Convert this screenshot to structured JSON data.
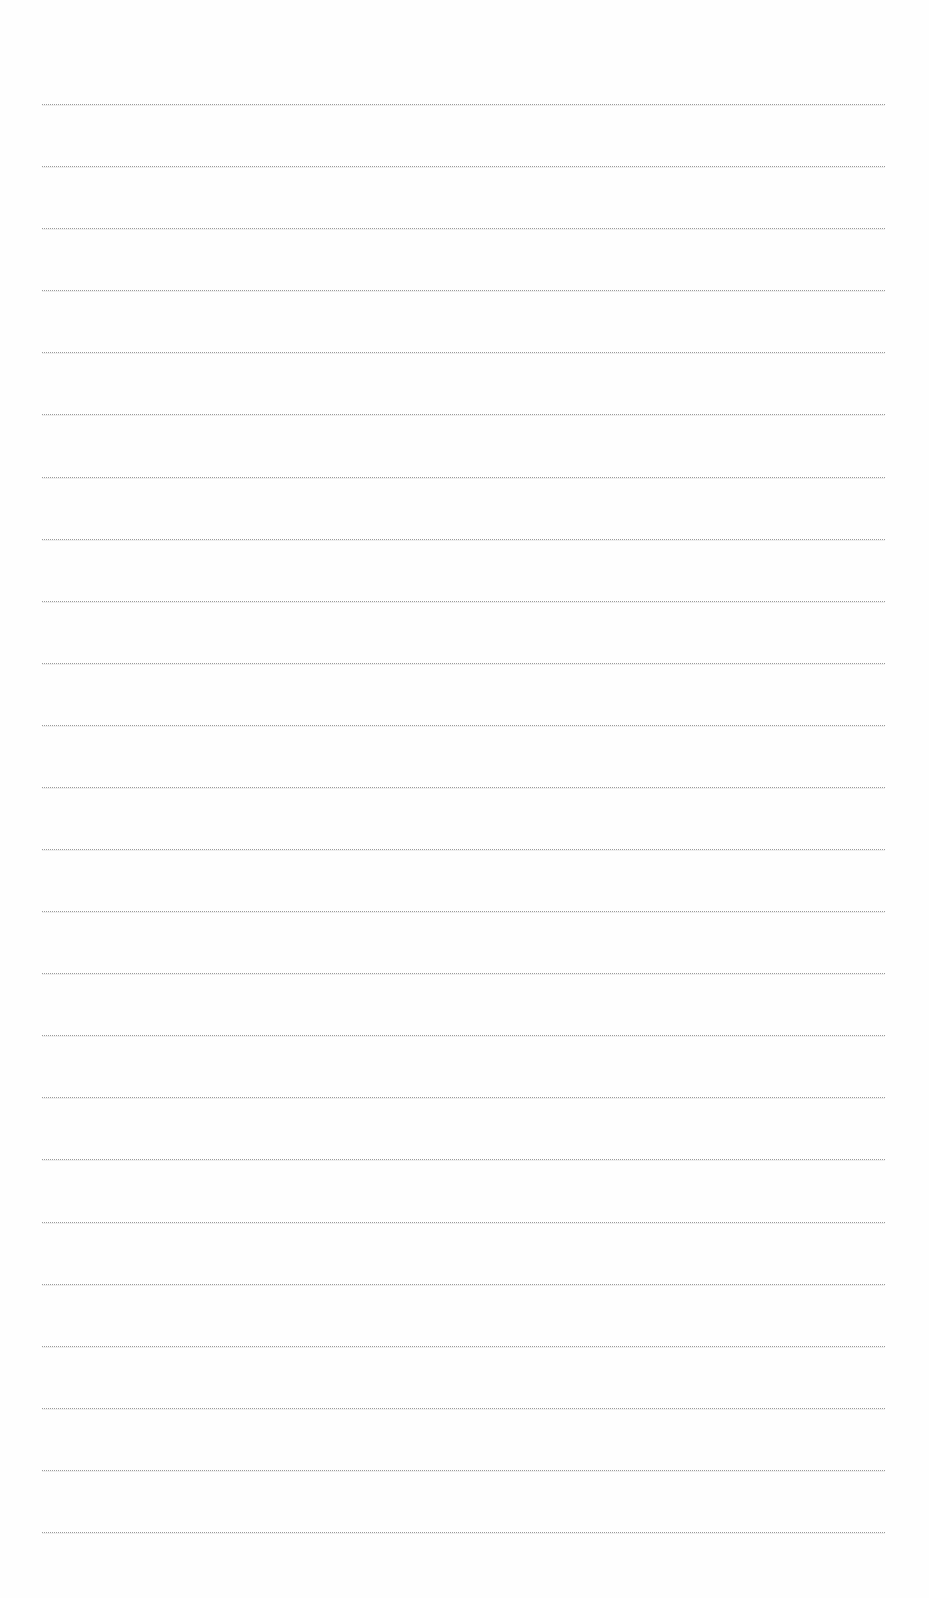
{
  "page": {
    "type": "lined-paper",
    "background_color": "#fefefe",
    "line_color": "#9a9a9a",
    "line_count": 24,
    "first_line_y": 104,
    "last_line_y": 1532,
    "line_left_x": 42,
    "line_right_x": 885
  }
}
